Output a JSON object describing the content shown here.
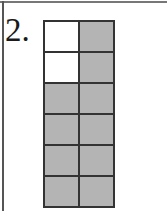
{
  "problem": {
    "number_label": "2."
  },
  "fraction_grid": {
    "columns": 2,
    "rows": 6,
    "total_parts": 12,
    "shaded_parts": 10,
    "shaded_color": "#b4b4b4",
    "unshaded_color": "#ffffff",
    "cells": [
      [
        "blank",
        "shaded"
      ],
      [
        "blank",
        "shaded"
      ],
      [
        "shaded",
        "shaded"
      ],
      [
        "shaded",
        "shaded"
      ],
      [
        "shaded",
        "shaded"
      ],
      [
        "shaded",
        "shaded"
      ]
    ]
  }
}
